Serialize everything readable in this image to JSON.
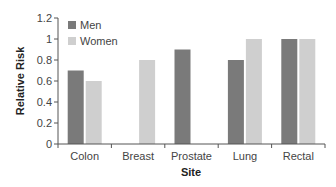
{
  "chart_data": {
    "type": "bar",
    "title": "",
    "xlabel": "Site",
    "ylabel": "Relative Risk",
    "categories": [
      "Colon",
      "Breast",
      "Prostate",
      "Lung",
      "Rectal"
    ],
    "series": [
      {
        "name": "Men",
        "color": "#7a7a7a",
        "values": [
          0.7,
          null,
          0.9,
          0.8,
          1.0
        ]
      },
      {
        "name": "Women",
        "color": "#cfcfcf",
        "values": [
          0.6,
          0.8,
          null,
          1.0,
          1.0
        ]
      }
    ],
    "yticks": [
      "0",
      "0.2",
      "0.4",
      "0.6",
      "0.8",
      "1",
      "1.2"
    ],
    "ylim": [
      0,
      1.2
    ],
    "grid": false,
    "legend_position": "top-left inside"
  }
}
